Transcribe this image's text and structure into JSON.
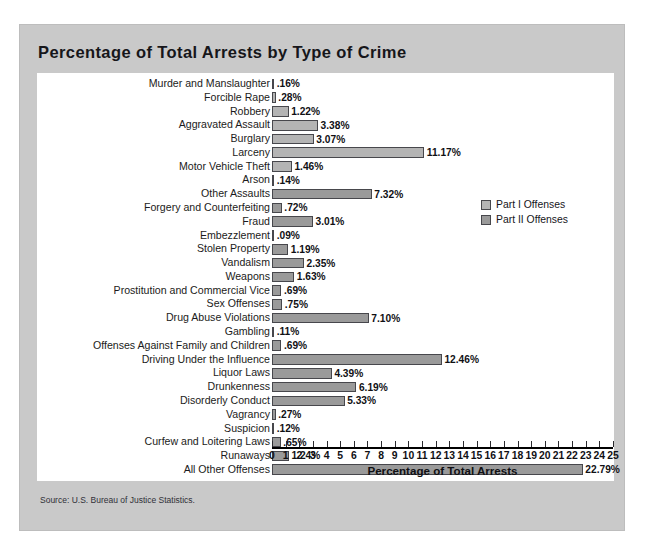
{
  "figure": {
    "title": "Percentage of Total Arrests by Type of Crime",
    "source": "Source: U.S. Bureau of Justice Statistics."
  },
  "legend": {
    "items": [
      {
        "label": "Part I Offenses",
        "color": "#b4b4b4",
        "key": "p1"
      },
      {
        "label": "Part II Offenses",
        "color": "#9a9a9a",
        "key": "p2"
      }
    ]
  },
  "chart_data": {
    "type": "bar",
    "orientation": "horizontal",
    "title": "Percentage of Total Arrests by Type of Crime",
    "xlabel": "Percentage of Total Arrests",
    "ylabel": "",
    "xlim": [
      0,
      25
    ],
    "xticks": [
      0,
      1,
      2,
      3,
      4,
      5,
      6,
      7,
      8,
      9,
      10,
      11,
      12,
      13,
      14,
      15,
      16,
      17,
      18,
      19,
      20,
      21,
      22,
      23,
      24,
      25
    ],
    "grid": false,
    "legend_position": "right",
    "categories": [
      "Murder and Manslaughter",
      "Forcible Rape",
      "Robbery",
      "Aggravated Assault",
      "Burglary",
      "Larceny",
      "Motor Vehicle Theft",
      "Arson",
      "Other Assaults",
      "Forgery and Counterfeiting",
      "Fraud",
      "Embezzlement",
      "Stolen Property",
      "Vandalism",
      "Weapons",
      "Prostitution and Commercial Vice",
      "Sex Offenses",
      "Drug Abuse Violations",
      "Gambling",
      "Offenses Against Family and Children",
      "Driving Under the Influence",
      "Liquor Laws",
      "Drunkenness",
      "Disorderly Conduct",
      "Vagrancy",
      "Suspicion",
      "Curfew and Loitering Laws",
      "Runaways",
      "All Other Offenses"
    ],
    "values": [
      0.16,
      0.28,
      1.22,
      3.38,
      3.07,
      11.17,
      1.46,
      0.14,
      7.32,
      0.72,
      3.01,
      0.09,
      1.19,
      2.35,
      1.63,
      0.69,
      0.75,
      7.1,
      0.11,
      0.69,
      12.46,
      4.39,
      6.19,
      5.33,
      0.27,
      0.12,
      0.65,
      1.24,
      22.79
    ],
    "value_labels": [
      ".16%",
      ".28%",
      "1.22%",
      "3.38%",
      "3.07%",
      "11.17%",
      "1.46%",
      ".14%",
      "7.32%",
      ".72%",
      "3.01%",
      ".09%",
      "1.19%",
      "2.35%",
      "1.63%",
      ".69%",
      ".75%",
      "7.10%",
      ".11%",
      ".69%",
      "12.46%",
      "4.39%",
      "6.19%",
      "5.33%",
      ".27%",
      ".12%",
      ".65%",
      "1.24%",
      "22.79%"
    ],
    "series_key": [
      "p1",
      "p1",
      "p1",
      "p1",
      "p1",
      "p1",
      "p1",
      "p1",
      "p2",
      "p2",
      "p2",
      "p2",
      "p2",
      "p2",
      "p2",
      "p2",
      "p2",
      "p2",
      "p2",
      "p2",
      "p2",
      "p2",
      "p2",
      "p2",
      "p2",
      "p2",
      "p2",
      "p2",
      "p2"
    ],
    "series": [
      {
        "name": "Part I Offenses",
        "color": "#b4b4b4"
      },
      {
        "name": "Part II Offenses",
        "color": "#9a9a9a"
      }
    ]
  }
}
